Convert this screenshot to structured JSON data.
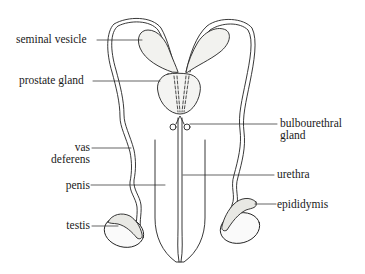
{
  "diagram": {
    "title": "",
    "stroke_color": "#222222",
    "fill_color": "#f3f3f1",
    "labels": {
      "seminal_vesicle": "seminal vesicle",
      "prostate_gland": "prostate gland",
      "bulbourethral_gland_1": "bulbourethral",
      "bulbourethral_gland_2": "gland",
      "vas_deferens_1": "vas",
      "vas_deferens_2": "deferens",
      "urethra": "urethra",
      "penis": "penis",
      "epididymis": "epididymis",
      "testis": "testis"
    }
  }
}
